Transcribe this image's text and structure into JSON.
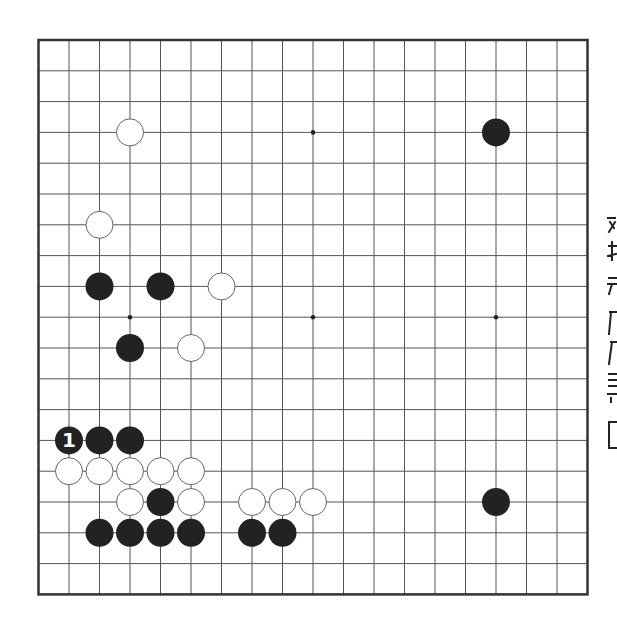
{
  "board": {
    "size": 19,
    "origin_x": 38.5,
    "origin_y": 40,
    "step_x": 30.5,
    "step_y": 30.8,
    "stone_radius": 14,
    "colors": {
      "background": "#ffffff",
      "grid_line": "#555555",
      "border": "#333333",
      "black_stone": "#222222",
      "white_stone_fill": "#ffffff",
      "white_stone_outline": "#666666",
      "star_point": "#222222",
      "label_on_black": "#ffffff"
    },
    "star_points": [
      [
        3,
        3
      ],
      [
        9,
        3
      ],
      [
        15,
        3
      ],
      [
        3,
        9
      ],
      [
        9,
        9
      ],
      [
        15,
        9
      ],
      [
        3,
        15
      ],
      [
        9,
        15
      ],
      [
        15,
        15
      ]
    ],
    "stones": [
      {
        "color": "white",
        "col": 3,
        "row": 3
      },
      {
        "color": "black",
        "col": 15,
        "row": 3
      },
      {
        "color": "white",
        "col": 2,
        "row": 6
      },
      {
        "color": "black",
        "col": 2,
        "row": 8
      },
      {
        "color": "black",
        "col": 4,
        "row": 8
      },
      {
        "color": "white",
        "col": 6,
        "row": 8
      },
      {
        "color": "black",
        "col": 3,
        "row": 10
      },
      {
        "color": "white",
        "col": 5,
        "row": 10
      },
      {
        "color": "black",
        "col": 1,
        "row": 13,
        "label": "1"
      },
      {
        "color": "black",
        "col": 2,
        "row": 13
      },
      {
        "color": "black",
        "col": 3,
        "row": 13
      },
      {
        "color": "white",
        "col": 1,
        "row": 14
      },
      {
        "color": "white",
        "col": 2,
        "row": 14
      },
      {
        "color": "white",
        "col": 3,
        "row": 14
      },
      {
        "color": "white",
        "col": 4,
        "row": 14
      },
      {
        "color": "white",
        "col": 5,
        "row": 14
      },
      {
        "color": "white",
        "col": 3,
        "row": 15
      },
      {
        "color": "black",
        "col": 4,
        "row": 15
      },
      {
        "color": "white",
        "col": 5,
        "row": 15
      },
      {
        "color": "white",
        "col": 7,
        "row": 15
      },
      {
        "color": "white",
        "col": 8,
        "row": 15
      },
      {
        "color": "white",
        "col": 9,
        "row": 15
      },
      {
        "color": "black",
        "col": 15,
        "row": 15
      },
      {
        "color": "black",
        "col": 2,
        "row": 16
      },
      {
        "color": "black",
        "col": 3,
        "row": 16
      },
      {
        "color": "black",
        "col": 4,
        "row": 16
      },
      {
        "color": "black",
        "col": 5,
        "row": 16
      },
      {
        "color": "black",
        "col": 7,
        "row": 16
      },
      {
        "color": "black",
        "col": 8,
        "row": 16
      }
    ]
  },
  "side_text": {
    "description": "vertical text column clipped at right edge (illegible fragments)",
    "glyph_count": 8
  }
}
